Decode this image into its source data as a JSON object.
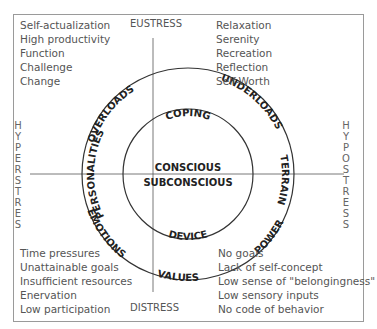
{
  "axes": {
    "top": "EUSTRESS",
    "bottom": "DISTRESS",
    "left": "HYPERSTRES",
    "right": "HYPOSTRESS"
  },
  "quadrants": {
    "top_left": [
      "Self-actualization",
      "High productivity",
      "Function",
      "Challenge",
      "Change"
    ],
    "top_right": [
      "Relaxation",
      "Serenity",
      "Recreation",
      "Reflection",
      "Self-Worth"
    ],
    "bottom_left": [
      "Time pressures",
      "Unattainable goals",
      "Insufficient resources",
      "Enervation",
      "Low participation"
    ],
    "bottom_right": [
      "No goals",
      "Lack of self-concept",
      "Low sense of \"belongingness\"",
      "Low sensory inputs",
      "No code of behavior"
    ]
  },
  "outer_ring": [
    "OVERLOADS",
    "UNDERLOADS",
    "TERRAIN",
    "POWER",
    "VALUES",
    "EMOTIONS",
    "PERSONALITIES"
  ],
  "inner_ring": {
    "top": "COPING",
    "bottom": "DEVICE"
  },
  "center": {
    "upper": "CONSCIOUS",
    "lower": "SUBCONSCIOUS"
  },
  "colors": {
    "line": "#333333",
    "text": "#555555",
    "ring_text": "#222222",
    "frame": "#9a9a9a"
  }
}
